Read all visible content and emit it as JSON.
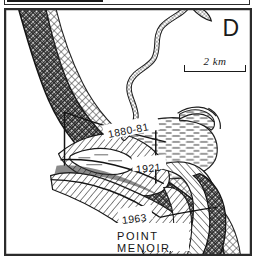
{
  "figure": {
    "panel_letter": "D",
    "caption_labels": {
      "point_name_line1": "POINT",
      "point_name_line2": "MENOIR"
    },
    "shoreline_dates": [
      {
        "id": "shoreline-1880-81",
        "label": "1880-81",
        "year_start": 1880,
        "year_end": 1881
      },
      {
        "id": "shoreline-1921",
        "label": "1921",
        "year_start": 1921,
        "year_end": 1921
      },
      {
        "id": "shoreline-1963",
        "label": "1963",
        "year_start": 1963,
        "year_end": 1963
      }
    ],
    "scale": {
      "label": "2 km",
      "value": 2,
      "unit": "km",
      "bar_length_px": 62
    },
    "colors": {
      "ink": "#1a1a1a",
      "frame": "#2b2b2b",
      "paper": "#ffffff",
      "hatch_dark": "#2a2a2a",
      "hatch_mid": "#3a3a3a",
      "marsh": "#444444"
    },
    "pattern_legend": [
      {
        "name": "dense-cross-hatch",
        "meaning": "oldest land unit / 1880-81 barrier"
      },
      {
        "name": "diagonal-hatch",
        "meaning": "intermediate land unit"
      },
      {
        "name": "horizontal-dash",
        "meaning": "marsh / tidal flat"
      },
      {
        "name": "stipple-channel",
        "meaning": "river channel"
      }
    ]
  }
}
